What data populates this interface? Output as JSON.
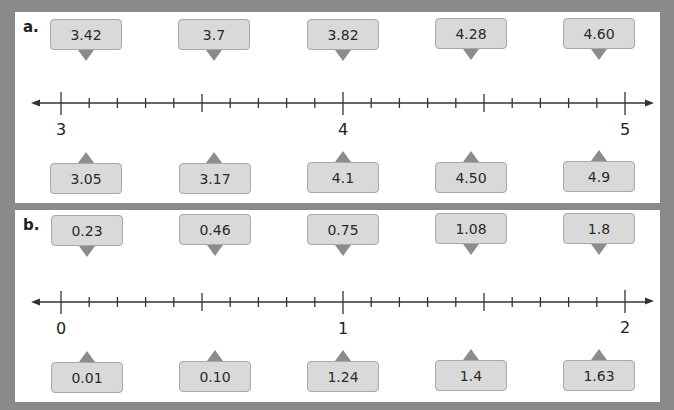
{
  "panels": [
    {
      "label": "a.",
      "axis": {
        "start": 3,
        "end": 5,
        "major_labels": [
          "3",
          "4",
          "5"
        ],
        "minor_step": 0.1
      },
      "top_values": [
        "3.42",
        "3.7",
        "3.82",
        "4.28",
        "4.60"
      ],
      "bottom_values": [
        "3.05",
        "3.17",
        "4.1",
        "4.50",
        "4.9"
      ]
    },
    {
      "label": "b.",
      "axis": {
        "start": 0,
        "end": 2,
        "major_labels": [
          "0",
          "1",
          "2"
        ],
        "minor_step": 0.1
      },
      "top_values": [
        "0.23",
        "0.46",
        "0.75",
        "1.08",
        "1.8"
      ],
      "bottom_values": [
        "0.01",
        "0.10",
        "1.24",
        "1.4",
        "1.63"
      ]
    }
  ],
  "colors": {
    "background": "#8a8a8a",
    "panel": "#ffffff",
    "box_fill": "#d9d9d9",
    "box_border": "#a8a8a8",
    "pointer": "#8c8c8c",
    "line": "#333333"
  }
}
